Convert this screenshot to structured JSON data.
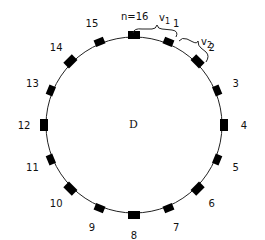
{
  "diagram": {
    "center_label": "D",
    "n_label": "n=16",
    "brace_labels": [
      "v1",
      "v2"
    ],
    "brace_label_parts": [
      {
        "base": "v",
        "sub": "1"
      },
      {
        "base": "v",
        "sub": "2"
      }
    ],
    "node_count": 16,
    "node_labels": [
      "1",
      "2",
      "3",
      "4",
      "5",
      "6",
      "7",
      "8",
      "9",
      "10",
      "11",
      "12",
      "13",
      "14",
      "15"
    ],
    "colors": {
      "stroke": "#222222",
      "node_fill": "#000000",
      "background": "#ffffff"
    }
  }
}
